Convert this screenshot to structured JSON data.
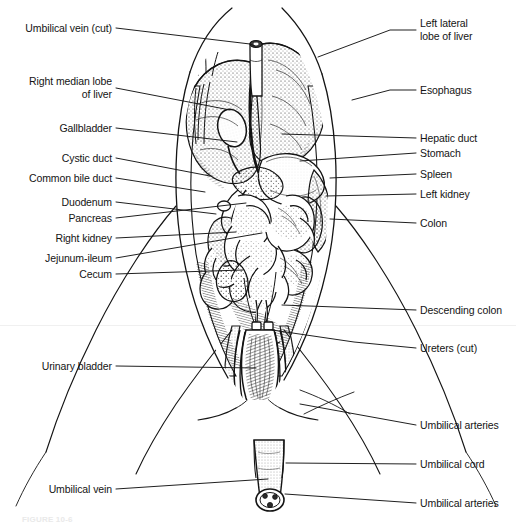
{
  "figure": {
    "caption": "FIGURE 10-6",
    "background_color": "#ffffff",
    "ink_color": "#141414"
  },
  "labels_left": [
    {
      "id": "umbilical-vein-cut",
      "text": "Umbilical vein (cut)",
      "x": 112,
      "y": 28,
      "leader": "M116,28 L250,44 L255,46"
    },
    {
      "id": "right-median-lobe-of-liver",
      "text": "Right median lobe",
      "text2": "of liver",
      "x": 112,
      "y": 88,
      "leader": "M116,88 L230,110"
    },
    {
      "id": "gallbladder",
      "text": "Gallbladder",
      "x": 112,
      "y": 128,
      "leader": "M116,128 L237,142"
    },
    {
      "id": "cystic-duct",
      "text": "Cystic duct",
      "x": 112,
      "y": 158,
      "leader": "M116,158 L210,176"
    },
    {
      "id": "common-bile-duct",
      "text": "Common bile duct",
      "x": 112,
      "y": 178,
      "leader": "M116,178 L205,192"
    },
    {
      "id": "duodenum",
      "text": "Duodenum",
      "x": 112,
      "y": 202,
      "leader": "M116,202 L216,214"
    },
    {
      "id": "pancreas",
      "text": "Pancreas",
      "x": 112,
      "y": 218,
      "leader": "M116,218 L246,203"
    },
    {
      "id": "right-kidney",
      "text": "Right kidney",
      "x": 112,
      "y": 238,
      "leader": "M116,238 L236,232"
    },
    {
      "id": "jejunum-ileum",
      "text": "Jejunum-ileum",
      "x": 112,
      "y": 258,
      "leader": "M116,258 L262,233"
    },
    {
      "id": "cecum",
      "text": "Cecum",
      "x": 112,
      "y": 274,
      "leader": "M116,274 L243,270"
    },
    {
      "id": "urinary-bladder",
      "text": "Urinary bladder",
      "x": 112,
      "y": 366,
      "leader": "M116,366 L256,368"
    },
    {
      "id": "umbilical-vein",
      "text": "Umbilical vein",
      "x": 112,
      "y": 489,
      "leader": "M116,489 L268,479"
    }
  ],
  "labels_right": [
    {
      "id": "left-lateral-lobe-of-liver",
      "text": "Left lateral",
      "text2": "lobe of liver",
      "x": 420,
      "y": 30,
      "leader": "M416,30 L390,30 L318,57"
    },
    {
      "id": "esophagus",
      "text": "Esophagus",
      "x": 420,
      "y": 90,
      "leader": "M416,90 L390,90 L352,100"
    },
    {
      "id": "hepatic-duct",
      "text": "Hepatic duct",
      "x": 420,
      "y": 138,
      "leader": "M416,138 L282,134"
    },
    {
      "id": "stomach",
      "text": "Stomach",
      "x": 420,
      "y": 153,
      "leader": "M416,153 L300,161"
    },
    {
      "id": "spleen",
      "text": "Spleen",
      "x": 420,
      "y": 174,
      "leader": "M416,174 L330,178"
    },
    {
      "id": "left-kidney",
      "text": "Left kidney",
      "x": 420,
      "y": 194,
      "leader": "M416,194 L326,196"
    },
    {
      "id": "colon",
      "text": "Colon",
      "x": 420,
      "y": 223,
      "leader": "M416,223 L330,219"
    },
    {
      "id": "descending-colon",
      "text": "Descending colon",
      "x": 420,
      "y": 310,
      "leader": "M416,310 L282,305"
    },
    {
      "id": "ureters-cut",
      "text": "Ureters (cut)",
      "x": 420,
      "y": 348,
      "leader": "M416,348 L354,342 L272,330"
    },
    {
      "id": "umbilical-arteries-upper",
      "text": "Umbilical arteries",
      "x": 420,
      "y": 425,
      "leader": "M416,425 L300,404"
    },
    {
      "id": "umbilical-cord",
      "text": "Umbilical cord",
      "x": 420,
      "y": 464,
      "leader": "M416,464 L286,463"
    },
    {
      "id": "umbilical-arteries-lower",
      "text": "Umbilical arteries",
      "x": 420,
      "y": 503,
      "leader": "M416,503 L285,494"
    }
  ],
  "illustration": {
    "description": "Ventral view of a dissected fetal pig abdomen showing the liver lobes, stomach, spleen, kidneys, coiled small and large intestine, urinary bladder, umbilical vessels and cut umbilical cord.",
    "structures": [
      "right median lobe of liver",
      "left lateral lobe of liver",
      "gallbladder",
      "cystic duct",
      "common bile duct",
      "hepatic duct",
      "duodenum",
      "pancreas",
      "stomach",
      "spleen",
      "esophagus",
      "right kidney",
      "left kidney",
      "jejunum-ileum",
      "cecum",
      "colon",
      "descending colon",
      "ureters",
      "urinary bladder",
      "umbilical arteries",
      "umbilical vein",
      "umbilical cord"
    ]
  }
}
